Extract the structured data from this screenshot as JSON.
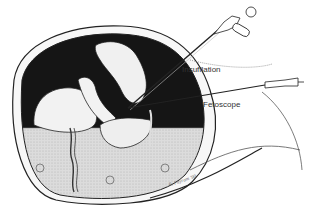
{
  "figure": {
    "labels": {
      "insufflation": "Insufflation",
      "fetoscope": "Fetoscope"
    },
    "signature": "B. Fayram '90",
    "colors": {
      "background": "#ffffff",
      "cavity": "#151515",
      "fluid": "#d6d6d6",
      "line": "#222222",
      "skin": "#f4f4f4"
    }
  }
}
